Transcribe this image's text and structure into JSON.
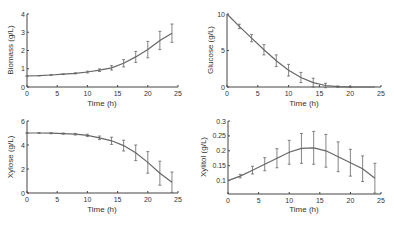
{
  "chart_data": [
    {
      "type": "line",
      "title": "",
      "xlabel": "Time (h)",
      "ylabel": "Biomass (g/L)",
      "xlim": [
        0,
        25
      ],
      "ylim": [
        0,
        4
      ],
      "xticks": [
        0,
        5,
        10,
        15,
        20,
        25
      ],
      "yticks": [
        0,
        1,
        2,
        3,
        4
      ],
      "ytick_labels": [
        "0",
        "1",
        "2",
        "3",
        "4"
      ],
      "grid": false,
      "x": [
        0,
        2,
        4,
        6,
        8,
        10,
        12,
        14,
        16,
        18,
        20,
        22,
        24
      ],
      "series": [
        {
          "name": "Biomass",
          "values": [
            0.6,
            0.62,
            0.66,
            0.7,
            0.75,
            0.82,
            0.92,
            1.05,
            1.3,
            1.65,
            2.05,
            2.55,
            2.95
          ],
          "error": [
            0.01,
            0.01,
            0.02,
            0.02,
            0.03,
            0.05,
            0.07,
            0.12,
            0.2,
            0.3,
            0.45,
            0.5,
            0.5
          ]
        }
      ]
    },
    {
      "type": "line",
      "title": "",
      "xlabel": "Time (h)",
      "ylabel": "Glucose (g/L)",
      "xlim": [
        0,
        25
      ],
      "ylim": [
        0,
        10
      ],
      "xticks": [
        0,
        5,
        10,
        15,
        20,
        25
      ],
      "yticks": [
        0,
        5,
        10
      ],
      "ytick_labels": [
        "0",
        "5",
        "10"
      ],
      "grid": false,
      "x": [
        0,
        2,
        4,
        6,
        8,
        10,
        12,
        14,
        16,
        18,
        20,
        22,
        24
      ],
      "series": [
        {
          "name": "Glucose",
          "values": [
            10,
            8.3,
            6.7,
            5.1,
            3.6,
            2.3,
            1.3,
            0.6,
            0.2,
            0.05,
            0.0,
            0.0,
            0.0
          ],
          "error": [
            0.0,
            0.3,
            0.5,
            0.7,
            0.8,
            0.8,
            0.7,
            0.6,
            0.3,
            0.1,
            0.05,
            0.0,
            0.0
          ]
        }
      ]
    },
    {
      "type": "line",
      "title": "",
      "xlabel": "Time (h)",
      "ylabel": "Xylose (g/L)",
      "xlim": [
        0,
        25
      ],
      "ylim": [
        0,
        6
      ],
      "xticks": [
        0,
        5,
        10,
        15,
        20,
        25
      ],
      "yticks": [
        0,
        2,
        4,
        6
      ],
      "ytick_labels": [
        "0",
        "2",
        "4",
        "6"
      ],
      "grid": false,
      "x": [
        0,
        2,
        4,
        6,
        8,
        10,
        12,
        14,
        16,
        18,
        20,
        22,
        24
      ],
      "series": [
        {
          "name": "Xylose",
          "values": [
            5.0,
            5.0,
            4.98,
            4.95,
            4.9,
            4.8,
            4.6,
            4.35,
            3.95,
            3.35,
            2.55,
            1.65,
            0.9
          ],
          "error": [
            0.02,
            0.03,
            0.04,
            0.05,
            0.07,
            0.1,
            0.15,
            0.3,
            0.45,
            0.65,
            0.9,
            1.0,
            0.85
          ]
        }
      ]
    },
    {
      "type": "line",
      "title": "",
      "xlabel": "Time (h)",
      "ylabel": "Xylitol (g/L)",
      "xlim": [
        0,
        25
      ],
      "ylim": [
        0.055,
        0.3
      ],
      "xticks": [
        0,
        5,
        10,
        15,
        20,
        25
      ],
      "yticks": [
        0.1,
        0.15,
        0.2,
        0.25,
        0.3
      ],
      "ytick_labels": [
        "0.1",
        "0.15",
        "0.2",
        "0.25",
        "0.3"
      ],
      "grid": false,
      "x": [
        0,
        2,
        4,
        6,
        8,
        10,
        12,
        14,
        16,
        18,
        20,
        22,
        24
      ],
      "series": [
        {
          "name": "Xylitol",
          "values": [
            0.1,
            0.115,
            0.135,
            0.155,
            0.175,
            0.195,
            0.208,
            0.21,
            0.2,
            0.18,
            0.16,
            0.14,
            0.108
          ],
          "error": [
            0.0,
            0.006,
            0.013,
            0.022,
            0.032,
            0.04,
            0.05,
            0.055,
            0.055,
            0.05,
            0.045,
            0.043,
            0.05
          ]
        }
      ]
    }
  ],
  "panels": [
    {
      "ylabel": "Biomass (g/L)",
      "xlabel": "Time (h)"
    },
    {
      "ylabel": "Glucose (g/L)",
      "xlabel": "Time (h)"
    },
    {
      "ylabel": "Xylose (g/L)",
      "xlabel": "Time (h)"
    },
    {
      "ylabel": "Xylitol (g/L)",
      "xlabel": "Time (h)"
    }
  ],
  "xtick_labels": [
    "0",
    "5",
    "10",
    "15",
    "20",
    "25"
  ],
  "colors": {
    "line": "#666666",
    "axis": "#444444",
    "text": "#333333"
  }
}
